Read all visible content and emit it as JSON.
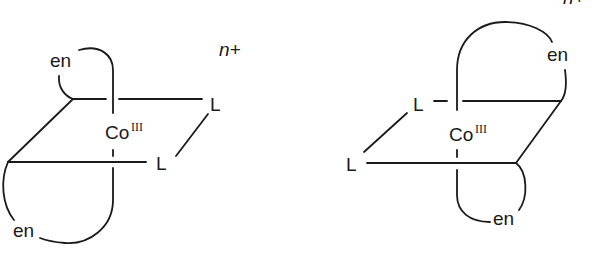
{
  "figure": {
    "left_isomer": {
      "metal": "Co",
      "oxidation_state": "III",
      "charge": "n+",
      "ligands": [
        "en",
        "en",
        "L",
        "L"
      ]
    },
    "right_isomer": {
      "metal": "Co",
      "oxidation_state": "III",
      "charge": "n+",
      "ligands": [
        "en",
        "en",
        "L",
        "L"
      ]
    }
  },
  "labels": {
    "en": "en",
    "L": "L",
    "co": "Co",
    "ox": "III",
    "charge": "n+"
  },
  "colors": {
    "ink": "#1a1a1a",
    "background": "#ffffff"
  }
}
